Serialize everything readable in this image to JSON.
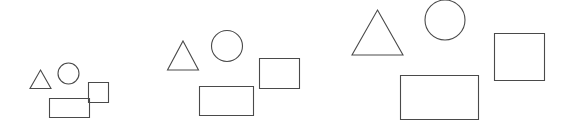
{
  "canvas": {
    "width": 564,
    "height": 132,
    "background_color": "#ffffff",
    "stroke_color": "#4a4a4a",
    "fill": "none",
    "stroke_width": 1.1
  },
  "scene": {
    "description": "three groups of four outlined geometric shapes at increasing scale",
    "group_count": 3,
    "shapes_per_group": 4
  },
  "groups": [
    {
      "name": "group-small",
      "scale_label": "small",
      "shapes": [
        {
          "name": "triangle",
          "type": "polygon",
          "points": "40.5,70 51,88.5 30,88.5"
        },
        {
          "name": "circle",
          "type": "circle",
          "cx": 68.5,
          "cy": 73.5,
          "r": 10.5
        },
        {
          "name": "square",
          "type": "rect",
          "x": 88.5,
          "y": 82.5,
          "width": 20,
          "height": 20
        },
        {
          "name": "rectangle",
          "type": "rect",
          "x": 49.5,
          "y": 98.5,
          "width": 40,
          "height": 19
        }
      ]
    },
    {
      "name": "group-medium",
      "scale_label": "medium",
      "shapes": [
        {
          "name": "triangle",
          "type": "polygon",
          "points": "183,41 198.5,70 167.5,70"
        },
        {
          "name": "circle",
          "type": "circle",
          "cx": 227,
          "cy": 46,
          "r": 15.5
        },
        {
          "name": "square",
          "type": "rect",
          "x": 259.5,
          "y": 58.5,
          "width": 40,
          "height": 30
        },
        {
          "name": "rectangle",
          "type": "rect",
          "x": 199.5,
          "y": 86.5,
          "width": 54,
          "height": 29
        }
      ]
    },
    {
      "name": "group-large",
      "scale_label": "large",
      "shapes": [
        {
          "name": "triangle",
          "type": "polygon",
          "points": "377.5,10 403,55 352,55"
        },
        {
          "name": "circle",
          "type": "circle",
          "cx": 445,
          "cy": 20,
          "r": 20
        },
        {
          "name": "square",
          "type": "rect",
          "x": 494.5,
          "y": 33.5,
          "width": 50,
          "height": 47
        },
        {
          "name": "rectangle",
          "type": "rect",
          "x": 400.5,
          "y": 75.5,
          "width": 78,
          "height": 44
        }
      ]
    }
  ]
}
